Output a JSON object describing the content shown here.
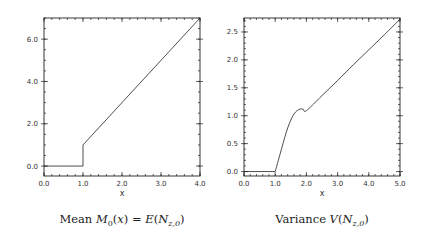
{
  "chart_data": [
    {
      "type": "line",
      "title": "",
      "caption": {
        "prefix": "Mean ",
        "math": "M",
        "sub0": "0",
        "mid": "(x) = E(N",
        "sub": "z,0",
        "suffix": ")"
      },
      "caption_text": "Mean M_0(x) = E(N_{z,0})",
      "xlabel": "x",
      "ylabel": "",
      "xlim": [
        0,
        4
      ],
      "ylim": [
        -0.47,
        7.0
      ],
      "xticks": [
        0,
        1,
        2,
        3,
        4
      ],
      "xtick_labels": [
        "0.0",
        "1.0",
        "2.0",
        "3.0",
        "4.0"
      ],
      "x_minor_step": 0.2,
      "yticks": [
        0,
        2,
        4,
        6
      ],
      "ytick_labels": [
        "0.0",
        "2.0",
        "4.0",
        "6.0"
      ],
      "y_minor_step": 0.5,
      "grid": false,
      "series": [
        {
          "name": "mean",
          "x": [
            0.0,
            1.0,
            1.0,
            4.0
          ],
          "y": [
            0.0,
            0.0,
            1.0,
            7.0
          ]
        }
      ]
    },
    {
      "type": "line",
      "title": "",
      "caption": {
        "prefix": "Variance ",
        "math": "V",
        "mid": "(N",
        "sub": "z,0",
        "suffix": ")"
      },
      "caption_text": "Variance V(N_{z,0})",
      "xlabel": "x",
      "ylabel": "",
      "xlim": [
        0,
        5
      ],
      "ylim": [
        -0.08,
        2.75
      ],
      "xticks": [
        0,
        1,
        2,
        3,
        4,
        5
      ],
      "xtick_labels": [
        "0.0",
        "1.0",
        "2.0",
        "3.0",
        "4.0",
        "5.0"
      ],
      "x_minor_step": 0.2,
      "yticks": [
        0,
        0.5,
        1.0,
        1.5,
        2.0,
        2.5
      ],
      "ytick_labels": [
        "0.0",
        "0.5",
        "1.0",
        "1.5",
        "2.0",
        "2.5"
      ],
      "y_minor_step": 0.1,
      "grid": false,
      "series": [
        {
          "name": "variance",
          "x": [
            0.0,
            1.0,
            1.1,
            1.2,
            1.3,
            1.4,
            1.5,
            1.6,
            1.7,
            1.8,
            1.9,
            2.0,
            2.5,
            3.0,
            3.5,
            4.0,
            4.5,
            5.0
          ],
          "y": [
            0.0,
            0.0,
            0.2,
            0.4,
            0.6,
            0.78,
            0.92,
            1.03,
            1.09,
            1.12,
            1.115,
            1.09,
            1.36,
            1.63,
            1.91,
            2.18,
            2.45,
            2.73
          ]
        }
      ]
    }
  ]
}
